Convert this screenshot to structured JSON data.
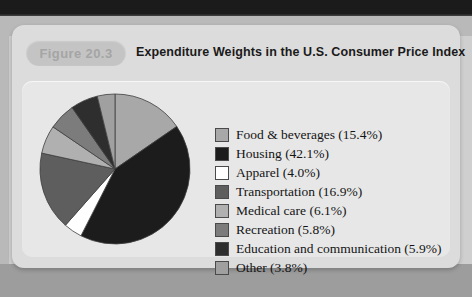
{
  "figure": {
    "badge": "Figure 20.3",
    "title": "Expenditure Weights in the U.S. Consumer Price Index"
  },
  "chart_data": {
    "type": "pie",
    "title": "Expenditure Weights in the U.S. Consumer Price Index",
    "legend_position": "right",
    "start_angle_deg": 0,
    "direction": "clockwise",
    "categories": [
      "Food & beverages",
      "Housing",
      "Apparel",
      "Transportation",
      "Medical care",
      "Recreation",
      "Education and communication",
      "Other"
    ],
    "values": [
      15.4,
      42.1,
      4.0,
      16.9,
      6.1,
      5.8,
      5.9,
      3.8
    ],
    "unit": "%",
    "colors": [
      "#a8a8a8",
      "#1c1c1c",
      "#ffffff",
      "#5e5e5e",
      "#b0b0b0",
      "#7c7c7c",
      "#2e2e2e",
      "#a0a0a0"
    ],
    "slices": [
      {
        "label": "Food & beverages",
        "value": 15.4,
        "legend": "Food & beverages (15.4%)",
        "color": "#a8a8a8"
      },
      {
        "label": "Housing",
        "value": 42.1,
        "legend": "Housing (42.1%)",
        "color": "#1c1c1c"
      },
      {
        "label": "Apparel",
        "value": 4.0,
        "legend": "Apparel (4.0%)",
        "color": "#ffffff"
      },
      {
        "label": "Transportation",
        "value": 16.9,
        "legend": "Transportation (16.9%)",
        "color": "#5e5e5e"
      },
      {
        "label": "Medical care",
        "value": 6.1,
        "legend": "Medical care (6.1%)",
        "color": "#b0b0b0"
      },
      {
        "label": "Recreation",
        "value": 5.8,
        "legend": "Recreation (5.8%)",
        "color": "#7c7c7c"
      },
      {
        "label": "Education and communication",
        "value": 5.9,
        "legend": "Education and communication (5.9%)",
        "color": "#2e2e2e"
      },
      {
        "label": "Other",
        "value": 3.8,
        "legend": "Other (3.8%)",
        "color": "#a0a0a0"
      }
    ]
  }
}
